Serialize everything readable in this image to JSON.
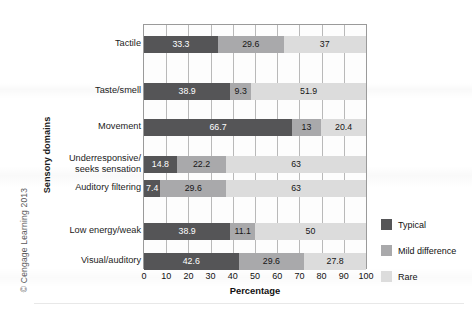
{
  "credit": "© Cengage Learning 2013",
  "chart_data": {
    "type": "bar",
    "orientation": "horizontal",
    "stacked": true,
    "title": "",
    "xlabel": "Percentage",
    "ylabel": "Sensory domains",
    "xlim": [
      0,
      100
    ],
    "xticks": [
      0,
      10,
      20,
      30,
      40,
      50,
      60,
      70,
      80,
      90,
      100
    ],
    "grid": "vertical",
    "legend_position": "right",
    "categories": [
      "Tactile",
      "Taste/smell",
      "Movement",
      "Underresponsive/ seeks sensation",
      "Auditory filtering",
      "Low energy/weak",
      "Visual/auditory"
    ],
    "category_lines": [
      [
        "Tactile"
      ],
      [
        "Taste/smell"
      ],
      [
        "Movement"
      ],
      [
        "Underresponsive/",
        "seeks sensation"
      ],
      [
        "Auditory filtering"
      ],
      [
        "Low energy/weak"
      ],
      [
        "Visual/auditory"
      ]
    ],
    "series": [
      {
        "name": "Typical",
        "color": "#555557",
        "values": [
          33.3,
          38.9,
          66.7,
          14.8,
          7.4,
          38.9,
          42.6
        ],
        "labels": [
          "33.3",
          "38.9",
          "66.7",
          "14.8",
          "7.4",
          "38.9",
          "42.6"
        ]
      },
      {
        "name": "Mild difference",
        "color": "#a9a9ab",
        "values": [
          29.6,
          9.3,
          13,
          22.2,
          29.6,
          11.1,
          29.6
        ],
        "labels": [
          "29.6",
          "9.3",
          "13",
          "22.2",
          "29.6",
          "11.1",
          "29.6"
        ]
      },
      {
        "name": "Rare",
        "color": "#dcdcdc",
        "values": [
          37,
          51.9,
          20.4,
          63,
          63,
          50,
          27.8
        ],
        "labels": [
          "37",
          "51.9",
          "20.4",
          "63",
          "63",
          "50",
          "27.8"
        ]
      }
    ]
  }
}
